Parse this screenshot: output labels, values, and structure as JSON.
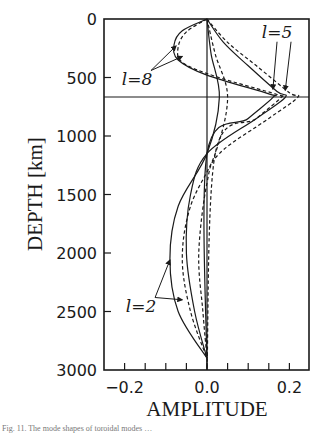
{
  "chart_data": {
    "type": "line",
    "title": "",
    "xlabel": "AMPLITUDE",
    "ylabel": "DEPTH [km]",
    "xlim": [
      -0.25,
      0.25
    ],
    "ylim": [
      3000,
      0
    ],
    "x_ticks": [
      -0.2,
      0.0,
      0.2
    ],
    "x_tick_labels": [
      "−0.2",
      "0.0",
      "0.2"
    ],
    "x_minor_ticks": [
      -0.15,
      -0.1,
      -0.05,
      0.05,
      0.1,
      0.15
    ],
    "y_ticks": [
      0,
      500,
      1000,
      1500,
      2000,
      2500,
      3000
    ],
    "y_tick_labels": [
      "0",
      "500",
      "1000",
      "1500",
      "2000",
      "2500",
      "3000"
    ],
    "reference_lines": {
      "vertical_x": 0.0,
      "horizontal_depth_km": 670
    },
    "grid": false,
    "legend": null,
    "annotations": [
      {
        "text": "l=8",
        "x": -0.17,
        "depth": 560,
        "arrows_to": [
          [
            -0.075,
            230
          ],
          [
            -0.06,
            320
          ]
        ]
      },
      {
        "text": "l=5",
        "x": 0.17,
        "depth": 160,
        "arrows_to": [
          [
            0.16,
            600
          ],
          [
            0.19,
            610
          ]
        ]
      },
      {
        "text": "l=2",
        "x": -0.16,
        "depth": 2500,
        "arrows_to": [
          [
            -0.09,
            2060
          ],
          [
            -0.06,
            2400
          ]
        ]
      }
    ],
    "series": [
      {
        "name": "l=8 solid",
        "style": "solid",
        "points": [
          [
            0,
            0
          ],
          [
            -0.06,
            100
          ],
          [
            -0.08,
            220
          ],
          [
            -0.07,
            350
          ],
          [
            0.0,
            480
          ],
          [
            0.15,
            640
          ],
          [
            0.16,
            670
          ],
          [
            0.1,
            850
          ],
          [
            0.0,
            1150
          ],
          [
            0,
            3000
          ]
        ]
      },
      {
        "name": "l=8 dashed",
        "style": "dashed",
        "points": [
          [
            0,
            0
          ],
          [
            -0.05,
            110
          ],
          [
            -0.07,
            240
          ],
          [
            -0.06,
            370
          ],
          [
            0.02,
            490
          ],
          [
            0.17,
            645
          ],
          [
            0.18,
            670
          ],
          [
            0.12,
            850
          ],
          [
            0.02,
            1150
          ],
          [
            0,
            3000
          ]
        ]
      },
      {
        "name": "l=5 solid",
        "style": "solid",
        "points": [
          [
            0,
            0
          ],
          [
            0.04,
            200
          ],
          [
            0.1,
            400
          ],
          [
            0.17,
            620
          ],
          [
            0.19,
            670
          ],
          [
            0.12,
            850
          ],
          [
            0.0,
            1150
          ],
          [
            -0.04,
            1500
          ],
          [
            -0.05,
            2000
          ],
          [
            -0.03,
            2500
          ],
          [
            0,
            2900
          ]
        ]
      },
      {
        "name": "l=5 dashed",
        "style": "dashed",
        "points": [
          [
            0,
            0
          ],
          [
            0.05,
            200
          ],
          [
            0.12,
            400
          ],
          [
            0.2,
            630
          ],
          [
            0.22,
            670
          ],
          [
            0.15,
            850
          ],
          [
            0.03,
            1150
          ],
          [
            0.0,
            1400
          ],
          [
            -0.02,
            2000
          ],
          [
            -0.01,
            2500
          ],
          [
            0,
            2900
          ]
        ]
      },
      {
        "name": "l=2 solid",
        "style": "solid",
        "points": [
          [
            0,
            0
          ],
          [
            0.01,
            300
          ],
          [
            0.03,
            670
          ],
          [
            0.0,
            1150
          ],
          [
            -0.07,
            1600
          ],
          [
            -0.09,
            2050
          ],
          [
            -0.07,
            2500
          ],
          [
            0,
            2900
          ]
        ]
      },
      {
        "name": "l=2 dashed",
        "style": "dashed",
        "points": [
          [
            0,
            0
          ],
          [
            0.02,
            300
          ],
          [
            0.05,
            670
          ],
          [
            0.02,
            1150
          ],
          [
            -0.04,
            1600
          ],
          [
            -0.06,
            2050
          ],
          [
            -0.04,
            2500
          ],
          [
            0,
            2900
          ]
        ]
      }
    ]
  },
  "caption": "Fig. 11. The mode shapes of toroidal modes …"
}
